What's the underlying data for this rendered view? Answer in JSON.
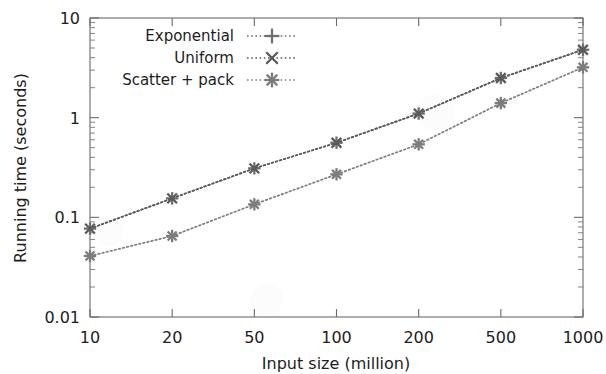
{
  "chart_data": {
    "type": "line",
    "title": "",
    "xlabel": "Input size (million)",
    "ylabel": "Running time (seconds)",
    "x_scale": "categorical-log",
    "y_scale": "log",
    "categories": [
      10,
      20,
      50,
      100,
      200,
      500,
      1000
    ],
    "xtick_labels": [
      "10",
      "20",
      "50",
      "100",
      "200",
      "500",
      "1000"
    ],
    "ytick_labels": [
      "10",
      "1",
      "0.1",
      "0.01"
    ],
    "ytick_values": [
      10,
      1,
      0.1,
      0.01
    ],
    "ylim": [
      0.01,
      10
    ],
    "grid": false,
    "legend_position": "top-center-inside",
    "minor_ticks": true,
    "series": [
      {
        "name": "Exponential",
        "marker": "plus",
        "linestyle": "dotted",
        "color": "#6f6f6f",
        "values": [
          0.077,
          0.155,
          0.31,
          0.56,
          1.1,
          2.5,
          4.8
        ]
      },
      {
        "name": "Uniform",
        "marker": "cross",
        "linestyle": "dotted",
        "color": "#5a5a5a",
        "values": [
          0.077,
          0.155,
          0.31,
          0.56,
          1.1,
          2.5,
          4.8
        ]
      },
      {
        "name": "Scatter + pack",
        "marker": "asterisk",
        "linestyle": "dotted",
        "color": "#7d7d7d",
        "values": [
          0.041,
          0.065,
          0.135,
          0.27,
          0.54,
          1.4,
          3.2
        ]
      }
    ]
  },
  "legend": {
    "entries": [
      {
        "label": "Exponential",
        "marker": "plus-marker"
      },
      {
        "label": "Uniform",
        "marker": "cross-marker"
      },
      {
        "label": "Scatter + pack",
        "marker": "asterisk-marker"
      }
    ]
  },
  "axes": {
    "x_label": "Input size (million)",
    "y_label": "Running time (seconds)",
    "x_ticks": [
      "10",
      "20",
      "50",
      "100",
      "200",
      "500",
      "1000"
    ],
    "y_ticks": [
      "10",
      "1",
      "0.1",
      "0.01"
    ]
  },
  "colors": {
    "axis": "#555555",
    "text": "#1d1d1d",
    "series_exponential": "#6f6f6f",
    "series_uniform": "#5a5a5a",
    "series_scatter_pack": "#7d7d7d",
    "background": "#ffffff"
  }
}
